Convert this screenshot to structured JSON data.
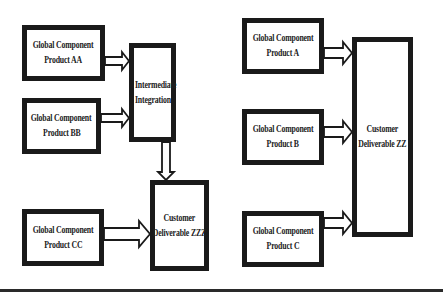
{
  "diagram": {
    "left_group": {
      "components": [
        {
          "id": "AA",
          "line1": "Global Component",
          "line2": "Product  AA"
        },
        {
          "id": "BB",
          "line1": "Global Component",
          "line2": "Product  BB"
        },
        {
          "id": "CC",
          "line1": "Global Component",
          "line2": "Product  CC"
        }
      ],
      "integration": {
        "line1": "Intermediate",
        "line2": "Integration"
      },
      "deliverable": {
        "line1": "Customer",
        "line2": "Deliverable  ZZZ"
      }
    },
    "right_group": {
      "components": [
        {
          "id": "A",
          "line1": "Global Component",
          "line2": "Product  A"
        },
        {
          "id": "B",
          "line1": "Global Component",
          "line2": "Product  B"
        },
        {
          "id": "C",
          "line1": "Global Component",
          "line2": "Product  C"
        }
      ],
      "deliverable": {
        "line1": "Customer",
        "line2": "Deliverable  ZZ"
      }
    },
    "edges": [
      {
        "from": "AA",
        "to": "Intermediate Integration"
      },
      {
        "from": "BB",
        "to": "Intermediate Integration"
      },
      {
        "from": "Intermediate Integration",
        "to": "Customer Deliverable ZZZ"
      },
      {
        "from": "CC",
        "to": "Customer Deliverable ZZZ"
      },
      {
        "from": "A",
        "to": "Customer Deliverable ZZ"
      },
      {
        "from": "B",
        "to": "Customer Deliverable ZZ"
      },
      {
        "from": "C",
        "to": "Customer Deliverable ZZ"
      }
    ],
    "colors": {
      "stroke": "#1a1a1a",
      "background": "#ffffff"
    }
  }
}
